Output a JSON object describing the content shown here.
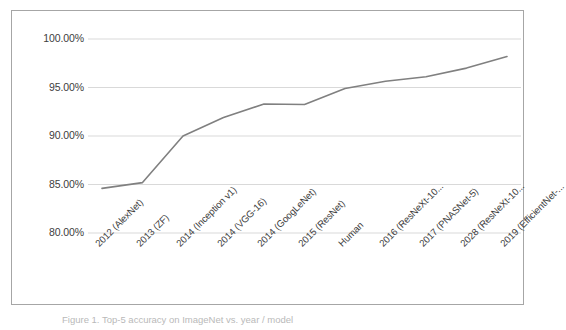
{
  "figure": {
    "caption": "Figure 1. Top-5 accuracy on ImageNet vs. year / model",
    "border_color": "#a6a6a6",
    "background": "#ffffff"
  },
  "chart_data": {
    "type": "line",
    "title": "",
    "xlabel": "",
    "ylabel": "",
    "grid": true,
    "legend": false,
    "line_color": "#808080",
    "gridline_color": "#d9d9d9",
    "ylim": [
      0.8,
      1.0
    ],
    "ytick_labels": [
      "100.00%",
      "95.00%",
      "90.00%",
      "85.00%",
      "80.00%"
    ],
    "ytick_values": [
      1.0,
      0.95,
      0.9,
      0.85,
      0.8
    ],
    "categories": [
      "2012 (AlexNet)",
      "2013 (ZF)",
      "2014 (Inception v1)",
      "2014 (VGG-16)",
      "2014 (GoogLeNet)",
      "2015 (ResNet)",
      "Human",
      "2016 (ResNeXt-10...",
      "2017 (PNASNet-5)",
      "2028 (ResNeXt-10...",
      "2019 (EfficientNet-..."
    ],
    "values": [
      0.846,
      0.852,
      0.9,
      0.919,
      0.933,
      0.9325,
      0.949,
      0.9565,
      0.961,
      0.97,
      0.982
    ],
    "value_labels": [
      "84.60%",
      "85.20%",
      "90.00%",
      "91.90%",
      "93.30%",
      "93.25%",
      "94.90%",
      "95.65%",
      "96.10%",
      "97.00%",
      "98.20%"
    ]
  }
}
